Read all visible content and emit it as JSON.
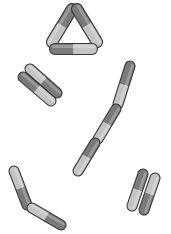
{
  "figure": {
    "colors": {
      "background": "#ffffff",
      "outline": "#3a3a3a",
      "dark_half": "#7a7a7a",
      "light_half": "#c4c4c4"
    },
    "groups": [
      {
        "name": "triangle",
        "rods": [
          {
            "x1": 52,
            "y1": 42,
            "x2": 72,
            "y2": 9,
            "w": 11,
            "dark_first": false
          },
          {
            "x1": 77,
            "y1": 9,
            "x2": 97,
            "y2": 42,
            "w": 11,
            "dark_first": true
          },
          {
            "x1": 55,
            "y1": 49,
            "x2": 92,
            "y2": 49,
            "w": 11,
            "dark_first": true
          }
        ]
      },
      {
        "name": "parallel-pair-left",
        "rods": [
          {
            "x1": 30,
            "y1": 69,
            "x2": 57,
            "y2": 93,
            "w": 10,
            "dark_first": false
          },
          {
            "x1": 23,
            "y1": 77,
            "x2": 51,
            "y2": 101,
            "w": 10,
            "dark_first": true
          }
        ]
      },
      {
        "name": "chain",
        "rods": [
          {
            "x1": 130,
            "y1": 66,
            "x2": 118,
            "y2": 104,
            "w": 10,
            "dark_first": true
          },
          {
            "x1": 116,
            "y1": 109,
            "x2": 98,
            "y2": 139,
            "w": 10,
            "dark_first": true
          },
          {
            "x1": 95,
            "y1": 143,
            "x2": 78,
            "y2": 171,
            "w": 10,
            "dark_first": true
          }
        ]
      },
      {
        "name": "bent-pair",
        "rods": [
          {
            "x1": 14,
            "y1": 171,
            "x2": 27,
            "y2": 205,
            "w": 10,
            "dark_first": false
          },
          {
            "x1": 32,
            "y1": 208,
            "x2": 61,
            "y2": 225,
            "w": 10,
            "dark_first": false
          }
        ]
      },
      {
        "name": "parallel-pair-right",
        "rods": [
          {
            "x1": 143,
            "y1": 174,
            "x2": 132,
            "y2": 206,
            "w": 10,
            "dark_first": true
          },
          {
            "x1": 155,
            "y1": 178,
            "x2": 144,
            "y2": 210,
            "w": 10,
            "dark_first": false
          }
        ]
      }
    ]
  }
}
